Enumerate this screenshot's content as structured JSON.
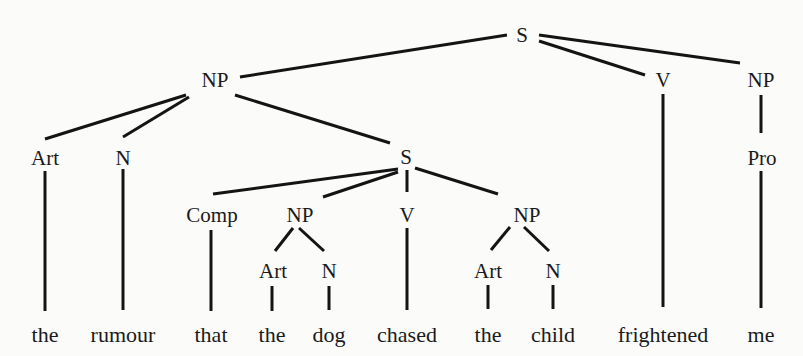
{
  "diagram": {
    "type": "syntax-tree",
    "nodes": [
      {
        "id": "S0",
        "label": "S",
        "x": 522,
        "y": 42
      },
      {
        "id": "NP1",
        "label": "NP",
        "x": 215,
        "y": 87
      },
      {
        "id": "V1",
        "label": "V",
        "x": 663,
        "y": 87
      },
      {
        "id": "NP2",
        "label": "NP",
        "x": 761,
        "y": 87
      },
      {
        "id": "Art1",
        "label": "Art",
        "x": 45,
        "y": 165
      },
      {
        "id": "N1",
        "label": "N",
        "x": 123,
        "y": 165
      },
      {
        "id": "S1",
        "label": "S",
        "x": 406,
        "y": 164
      },
      {
        "id": "Pro1",
        "label": "Pro",
        "x": 762,
        "y": 165
      },
      {
        "id": "Comp1",
        "label": "Comp",
        "x": 212,
        "y": 222
      },
      {
        "id": "NP3",
        "label": "NP",
        "x": 300,
        "y": 222
      },
      {
        "id": "V2",
        "label": "V",
        "x": 407,
        "y": 222
      },
      {
        "id": "NP4",
        "label": "NP",
        "x": 527,
        "y": 222
      },
      {
        "id": "Art2",
        "label": "Art",
        "x": 273,
        "y": 278
      },
      {
        "id": "N2",
        "label": "N",
        "x": 329,
        "y": 278
      },
      {
        "id": "Art3",
        "label": "Art",
        "x": 488,
        "y": 278
      },
      {
        "id": "N3",
        "label": "N",
        "x": 553,
        "y": 278
      }
    ],
    "words": [
      {
        "text": "the",
        "x": 45
      },
      {
        "text": "rumour",
        "x": 123
      },
      {
        "text": "that",
        "x": 211
      },
      {
        "text": "the",
        "x": 272
      },
      {
        "text": "dog",
        "x": 329
      },
      {
        "text": "chased",
        "x": 407
      },
      {
        "text": "the",
        "x": 488
      },
      {
        "text": "child",
        "x": 553
      },
      {
        "text": "frightened",
        "x": 663
      },
      {
        "text": "me",
        "x": 761
      }
    ],
    "words_y": 342,
    "edges": [
      {
        "from": "S0",
        "to": "NP1",
        "x1": 507,
        "y1": 35,
        "x2": 240,
        "y2": 77
      },
      {
        "from": "S0",
        "to": "V1",
        "x1": 539,
        "y1": 41,
        "x2": 645,
        "y2": 75
      },
      {
        "from": "S0",
        "to": "NP2",
        "x1": 539,
        "y1": 35,
        "x2": 740,
        "y2": 63
      },
      {
        "from": "NP1",
        "to": "Art1",
        "x1": 186,
        "y1": 95,
        "x2": 45,
        "y2": 139
      },
      {
        "from": "NP1",
        "to": "N1",
        "x1": 189,
        "y1": 97,
        "x2": 123,
        "y2": 137
      },
      {
        "from": "NP1",
        "to": "S1",
        "x1": 235,
        "y1": 95,
        "x2": 390,
        "y2": 143
      },
      {
        "from": "NP2",
        "to": "Pro1",
        "x1": 761,
        "y1": 95,
        "x2": 761,
        "y2": 133
      },
      {
        "from": "S1",
        "to": "Comp1",
        "x1": 398,
        "y1": 169,
        "x2": 213,
        "y2": 194
      },
      {
        "from": "S1",
        "to": "NP3",
        "x1": 398,
        "y1": 172,
        "x2": 323,
        "y2": 197
      },
      {
        "from": "S1",
        "to": "V2",
        "x1": 407,
        "y1": 170,
        "x2": 407,
        "y2": 192
      },
      {
        "from": "S1",
        "to": "NP4",
        "x1": 415,
        "y1": 168,
        "x2": 498,
        "y2": 194
      },
      {
        "from": "NP3",
        "to": "Art2",
        "x1": 293,
        "y1": 228,
        "x2": 275,
        "y2": 251
      },
      {
        "from": "NP3",
        "to": "N2",
        "x1": 299,
        "y1": 228,
        "x2": 324,
        "y2": 251
      },
      {
        "from": "NP4",
        "to": "Art3",
        "x1": 510,
        "y1": 227,
        "x2": 491,
        "y2": 250
      },
      {
        "from": "NP4",
        "to": "N3",
        "x1": 524,
        "y1": 227,
        "x2": 549,
        "y2": 251
      },
      {
        "from": "Art1",
        "to": "w0",
        "x1": 45,
        "y1": 171,
        "x2": 45,
        "y2": 311
      },
      {
        "from": "N1",
        "to": "w1",
        "x1": 123,
        "y1": 169,
        "x2": 123,
        "y2": 310
      },
      {
        "from": "Comp1",
        "to": "w2",
        "x1": 211,
        "y1": 230,
        "x2": 211,
        "y2": 311
      },
      {
        "from": "Art2",
        "to": "w3",
        "x1": 272,
        "y1": 286,
        "x2": 272,
        "y2": 311
      },
      {
        "from": "N2",
        "to": "w4",
        "x1": 329,
        "y1": 286,
        "x2": 329,
        "y2": 310
      },
      {
        "from": "V2",
        "to": "w5",
        "x1": 407,
        "y1": 228,
        "x2": 407,
        "y2": 310
      },
      {
        "from": "Art3",
        "to": "w6",
        "x1": 488,
        "y1": 285,
        "x2": 488,
        "y2": 309
      },
      {
        "from": "N3",
        "to": "w7",
        "x1": 553,
        "y1": 285,
        "x2": 553,
        "y2": 309
      },
      {
        "from": "V1",
        "to": "w8",
        "x1": 663,
        "y1": 94,
        "x2": 663,
        "y2": 307
      },
      {
        "from": "Pro1",
        "to": "w9",
        "x1": 761,
        "y1": 171,
        "x2": 761,
        "y2": 308
      }
    ]
  }
}
